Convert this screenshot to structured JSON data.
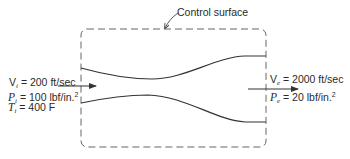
{
  "figure": {
    "control_surface_label": "Control surface",
    "inlet": {
      "velocity": {
        "symbol": "V",
        "subscript": "i",
        "value": "= 200 ft/sec"
      },
      "pressure": {
        "symbol": "P",
        "subscript": "i",
        "value": "= 100 lbf/in.",
        "superscript": "2"
      },
      "temperature": {
        "symbol": "T",
        "subscript": "i",
        "value": "= 400 F"
      }
    },
    "exit": {
      "velocity": {
        "symbol": "V",
        "subscript": "e",
        "value": "= 2000 ft/sec"
      },
      "pressure": {
        "symbol": "P",
        "subscript": "e",
        "value": "= 20 lbf/in.",
        "superscript": "2"
      }
    },
    "caption": ""
  },
  "colors": {
    "line": "#333333",
    "dashed": "#555555",
    "text": "#2a2a2a"
  }
}
